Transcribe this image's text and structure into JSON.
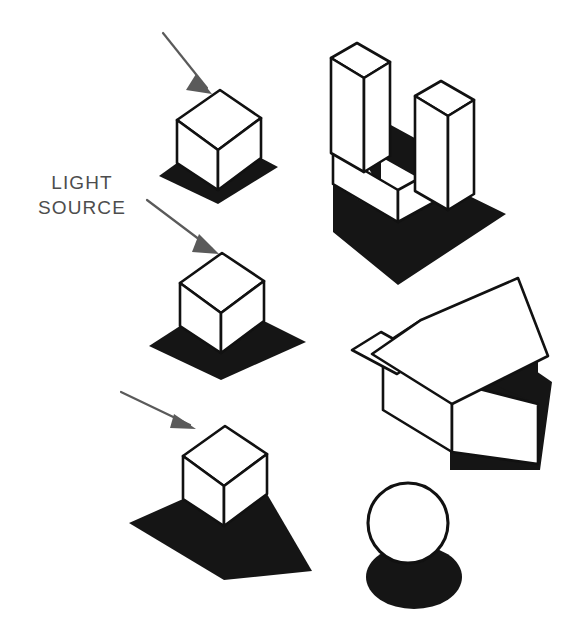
{
  "figure": {
    "background_color": "#ffffff",
    "ink_color": "#111111",
    "shadow_color": "#151515",
    "arrow_color": "#5a5a5a",
    "width": 579,
    "height": 640
  },
  "annotations": {
    "light_source_line1": "LIGHT",
    "light_source_line2": "SOURCE",
    "label_color": "#4d4d4d",
    "label_font_size": 19,
    "label_x": 82,
    "label_line1_y": 189,
    "label_line2_y": 214
  },
  "light_rays": [
    {
      "id": "ray-steep",
      "description": "steep light ray above first cube",
      "angle_degrees": 67,
      "x1": 163,
      "y1": 33,
      "x2": 207,
      "y2": 88,
      "head": "196,74 212,94 186,90"
    },
    {
      "id": "ray-medium",
      "description": "medium light ray above second cube",
      "angle_degrees": 47,
      "x1": 147,
      "y1": 200,
      "x2": 212,
      "y2": 249,
      "head": "199,234 219,254 192,252"
    },
    {
      "id": "ray-shallow",
      "description": "shallow light ray above third cube",
      "angle_degrees": 27,
      "x1": 121,
      "y1": 392,
      "x2": 190,
      "y2": 425,
      "head": "174,414 196,429 170,428"
    }
  ],
  "objects": [
    {
      "id": "cube-1",
      "name": "cube-short-shadow",
      "shadow_length": "short",
      "top_face": "177,120 220,90 261,118 218,150",
      "left_face": "177,120 218,150 218,190 177,163",
      "right_face": "218,150 261,118 261,158 218,190",
      "shadow": "177,163 218,190 218,203 160,176",
      "shadow2": "218,190 261,158 277,167 218,203"
    },
    {
      "id": "cube-2",
      "name": "cube-medium-shadow",
      "shadow_length": "medium",
      "top_face": "180,283 222,253 264,281 221,313",
      "left_face": "180,283 221,313 221,353 180,326",
      "right_face": "221,313 264,281 264,321 221,353",
      "shadow": "180,326 221,353 221,379 150,346",
      "shadow2": "221,353 264,321 305,342 221,379"
    },
    {
      "id": "cube-3",
      "name": "cube-long-shadow",
      "shadow_length": "long",
      "top_face": "183,456 225,426 267,454 224,486",
      "left_face": "183,456 224,486 224,526 183,499",
      "right_face": "224,486 267,454 267,494 224,526",
      "shadow": "183,499 224,526 224,578 130,523",
      "shadow2": "224,526 267,494 310,570 224,578"
    },
    {
      "id": "u-block",
      "name": "u-shaped-block",
      "description": "U-shaped slotted block with ground shadow and interior shadow",
      "base_shadow": "331,148 352,161 352,192 400,220 460,186 505,212 400,283 331,228",
      "interior_shadow": "357,108 420,140 420,178 380,155 380,188 357,145",
      "prong_left_top": "331,58 356,43 389,62 364,78",
      "prong_left_front": "331,58 364,78 364,171 331,152",
      "prong_left_side": "364,78 389,62 389,155 364,171",
      "prong_right_top": "416,96 441,81 474,100 449,116",
      "prong_right_front": "416,96 449,116 449,208 416,189",
      "prong_right_side": "449,116 474,100 474,192 449,208",
      "base_top": "331,152 364,171 400,192 449,208 449,192 400,176 364,155 331,136",
      "base_front": "331,152 400,192 400,222 331,182",
      "base_side": "400,192 449,208 449,238 400,222"
    },
    {
      "id": "house",
      "name": "gabled-house",
      "description": "house with overhanging gable roof, dark shaded wall and ground shadow",
      "ground_shadow": "392,408 434,440 448,425 448,468 538,468 548,385 520,362 452,400 425,382",
      "wall_shadow_band": "452,325 530,363 530,400 452,362",
      "wall_front": "385,345 452,382 452,452 385,408",
      "wall_side": "452,382 530,400 530,462 452,452",
      "roof_right": "372,353 452,310 546,358 460,404",
      "roof_left_eave": "352,348 378,335 458,378 435,392",
      "gable_face": "385,345 421,322 452,340 452,382",
      "roof_ridge": "421,322 516,281 546,358 452,310",
      "eave_shadow": "385,345 421,322 452,340 452,362 406,340"
    },
    {
      "id": "sphere",
      "name": "sphere-with-elliptical-shadow",
      "circle_cx": 408,
      "circle_cy": 523,
      "circle_r": 40,
      "shadow_cx": 414,
      "shadow_cy": 577,
      "shadow_rx": 48,
      "shadow_ry": 32
    }
  ]
}
